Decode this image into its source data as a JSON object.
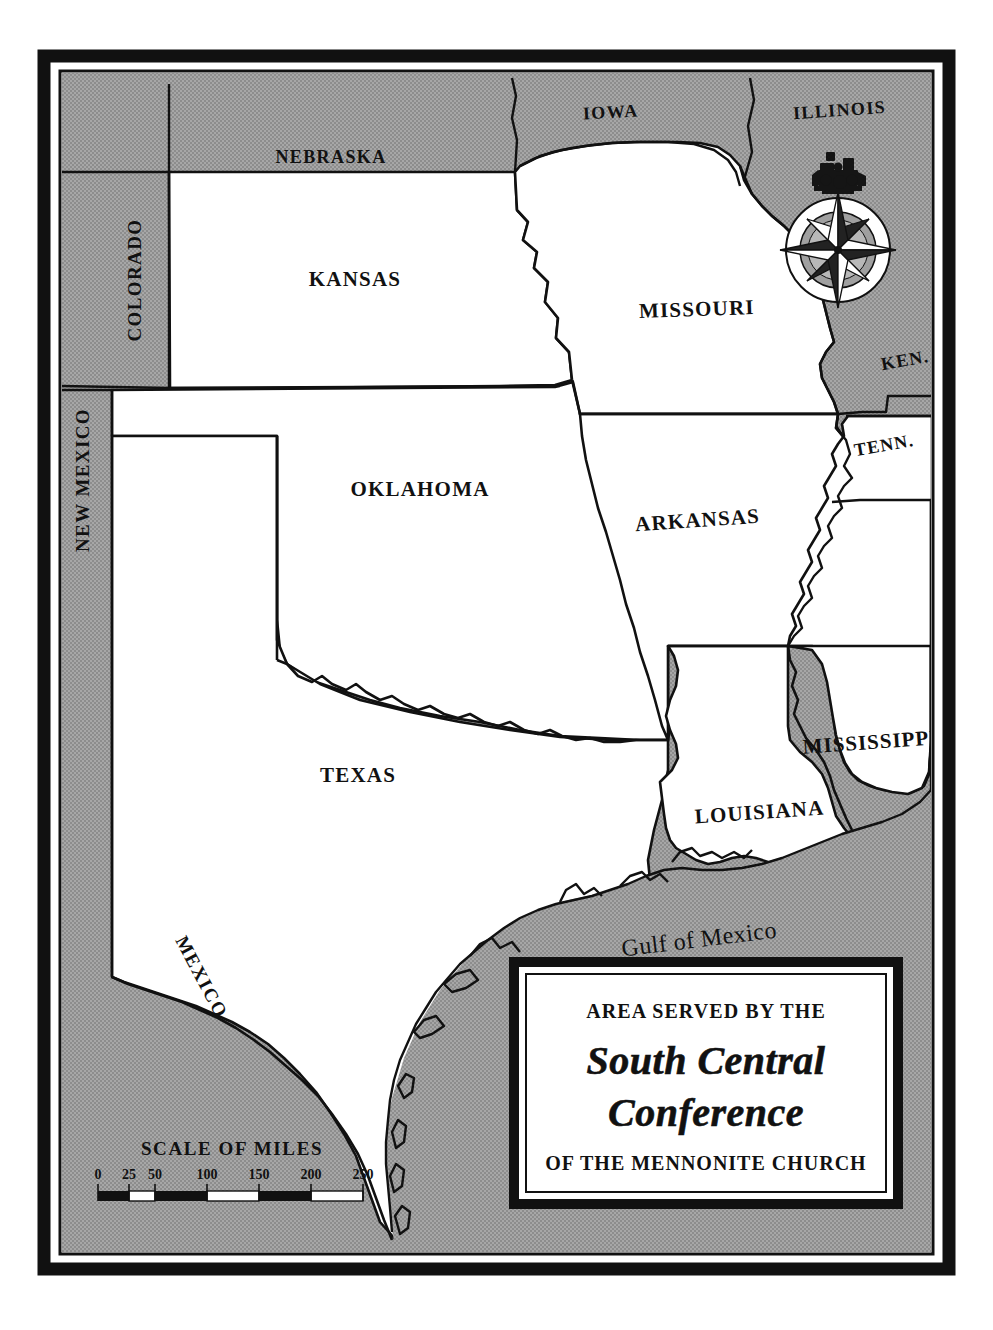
{
  "document": {
    "kind": "printed-map",
    "page_background": "#ffffff"
  },
  "colors": {
    "land_outside": "#9c9c9c",
    "land_inside": "#ffffff",
    "water": "#9c9c9c",
    "ink": "#111111",
    "frame": "#111111",
    "cartouche_fill": "#ffffff"
  },
  "frame": {
    "outer_border_color": "#111111",
    "inner_line_color": "#111111"
  },
  "map": {
    "member_states": [
      {
        "name": "KANSAS",
        "label": "KANSAS",
        "x": 355,
        "y": 280,
        "rotate": 0,
        "size": 21,
        "spacing": 1.2
      },
      {
        "name": "OKLAHOMA",
        "label": "OKLAHOMA",
        "x": 420,
        "y": 490,
        "rotate": 0,
        "size": 21,
        "spacing": 1.2
      },
      {
        "name": "TEXAS",
        "label": "TEXAS",
        "x": 358,
        "y": 775,
        "rotate": 0,
        "size": 21,
        "spacing": 1.2
      },
      {
        "name": "MISSOURI",
        "label": "MISSOURI",
        "x": 697,
        "y": 309,
        "rotate": -2,
        "size": 21,
        "spacing": 1.2
      },
      {
        "name": "ARKANSAS",
        "label": "ARKANSAS",
        "x": 698,
        "y": 520,
        "rotate": -4,
        "size": 21,
        "spacing": 1.2
      },
      {
        "name": "LOUISIANA",
        "label": "LOUISIANA",
        "x": 760,
        "y": 812,
        "rotate": -4,
        "size": 21,
        "spacing": 1.2
      },
      {
        "name": "MISSISSIPPI",
        "label": "MISSISSIPPI",
        "x": 871,
        "y": 742,
        "rotate": -4,
        "size": 21,
        "spacing": 1.0
      }
    ],
    "neighbor_states": [
      {
        "name": "COLORADO",
        "label": "COLORADO",
        "x": 141,
        "y": 280,
        "rotate": -90,
        "size": 19,
        "spacing": 1.4
      },
      {
        "name": "NEBRASKA",
        "label": "NEBRASKA",
        "x": 331,
        "y": 157,
        "rotate": 0,
        "size": 18,
        "spacing": 1.4
      },
      {
        "name": "IOWA",
        "label": "IOWA",
        "x": 611,
        "y": 112,
        "rotate": -3,
        "size": 18,
        "spacing": 1.4
      },
      {
        "name": "ILLINOIS",
        "label": "ILLINOIS",
        "x": 840,
        "y": 110,
        "rotate": -4,
        "size": 18,
        "spacing": 1.4
      },
      {
        "name": "NEW MEXICO",
        "label": "NEW MEXICO",
        "x": 89,
        "y": 480,
        "rotate": -90,
        "size": 19,
        "spacing": 1.4
      },
      {
        "name": "KEN.",
        "label": "KEN.",
        "x": 906,
        "y": 360,
        "rotate": -10,
        "size": 18,
        "spacing": 1.2
      },
      {
        "name": "TENN.",
        "label": "TENN.",
        "x": 885,
        "y": 445,
        "rotate": -10,
        "size": 18,
        "spacing": 1.2
      },
      {
        "name": "ALABAMA",
        "label": "ALABAMA",
        "x": 963,
        "y": 545,
        "rotate": -90,
        "size": 17,
        "spacing": 1.4
      },
      {
        "name": "MEXICO",
        "label": "MEXICO",
        "x": 196,
        "y": 980,
        "rotate": 62,
        "size": 19,
        "spacing": 1.6
      }
    ],
    "water_labels": [
      {
        "name": "Gulf of Mexico",
        "label": "Gulf of Mexico",
        "x": 700,
        "y": 940,
        "size": 24
      }
    ]
  },
  "compass": {
    "name": "compass-rose",
    "locomotive_icon": "locomotive-icon",
    "cx": 838,
    "cy": 250,
    "r": 52
  },
  "scale_bar": {
    "title": "SCALE OF MILES",
    "unit": "miles",
    "ticks": [
      "0",
      "25",
      "50",
      "100",
      "150",
      "200",
      "250"
    ],
    "tick_values": [
      0,
      25,
      50,
      100,
      150,
      200,
      250
    ],
    "max": 250
  },
  "cartouche": {
    "line1": "AREA SERVED BY THE",
    "line2": "South Central",
    "line3": "Conference",
    "line4": "OF THE MENNONITE CHURCH"
  }
}
